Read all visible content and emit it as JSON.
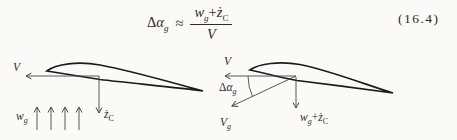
{
  "colors": {
    "paper": "#fbfaf7",
    "line_ink": "#464646",
    "airfoil_ink": "#1c1c1c",
    "text_ink": "#2d2d2d"
  },
  "equation": {
    "delta": "Δ",
    "alpha": "α",
    "lhs_sub": "g",
    "relation": "≈",
    "num_w": "w",
    "num_w_sub": "g",
    "num_plus": "+",
    "num_zdot": "ż",
    "num_z_sub": "C",
    "den": "V",
    "number": "(16.4)"
  },
  "left_diagram": {
    "v": "V",
    "w": "w",
    "w_sub": "g",
    "zdot": "ż",
    "z_sub": "C"
  },
  "right_diagram": {
    "v": "V",
    "delta": "Δ",
    "alpha": "α",
    "angle_sub": "g",
    "vg": "V",
    "vg_sub": "g",
    "w": "w",
    "w_sub": "g",
    "plus": "+",
    "zdot": "ż",
    "z_sub": "C"
  }
}
